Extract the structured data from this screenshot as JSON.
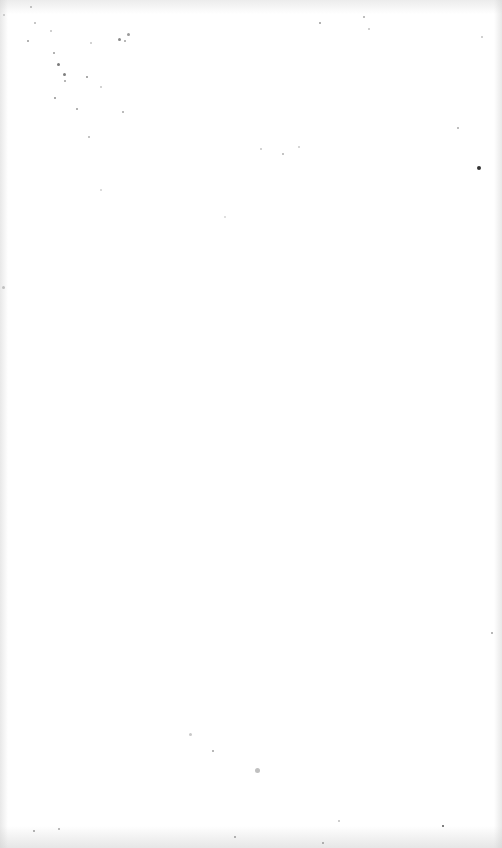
{
  "page": {
    "background": "#ffffff",
    "content_text": ""
  },
  "specks": [
    {
      "x": 30,
      "y": 6,
      "s": 2,
      "c": "#b0b0b0"
    },
    {
      "x": 3,
      "y": 14,
      "s": 2,
      "c": "#c0c0c0"
    },
    {
      "x": 34,
      "y": 22,
      "s": 2,
      "c": "#b5b5b5"
    },
    {
      "x": 27,
      "y": 40,
      "s": 2,
      "c": "#9a9a9a"
    },
    {
      "x": 50,
      "y": 30,
      "s": 2,
      "c": "#c0c0c0"
    },
    {
      "x": 118,
      "y": 38,
      "s": 3,
      "c": "#8a8a8a"
    },
    {
      "x": 127,
      "y": 33,
      "s": 3,
      "c": "#9a9a9a"
    },
    {
      "x": 124,
      "y": 40,
      "s": 2,
      "c": "#a0a0a0"
    },
    {
      "x": 90,
      "y": 42,
      "s": 2,
      "c": "#c5c5c5"
    },
    {
      "x": 53,
      "y": 52,
      "s": 2,
      "c": "#9a9a9a"
    },
    {
      "x": 57,
      "y": 63,
      "s": 3,
      "c": "#7a7a7a"
    },
    {
      "x": 63,
      "y": 73,
      "s": 3,
      "c": "#7f7f7f"
    },
    {
      "x": 64,
      "y": 80,
      "s": 2,
      "c": "#9f9f9f"
    },
    {
      "x": 86,
      "y": 76,
      "s": 2,
      "c": "#8f8f8f"
    },
    {
      "x": 100,
      "y": 86,
      "s": 2,
      "c": "#c5c5c5"
    },
    {
      "x": 54,
      "y": 97,
      "s": 2,
      "c": "#8f8f8f"
    },
    {
      "x": 76,
      "y": 108,
      "s": 2,
      "c": "#9a9a9a"
    },
    {
      "x": 122,
      "y": 111,
      "s": 2,
      "c": "#a5a5a5"
    },
    {
      "x": 88,
      "y": 136,
      "s": 2,
      "c": "#b0b0b0"
    },
    {
      "x": 100,
      "y": 189,
      "s": 2,
      "c": "#d0d0d0"
    },
    {
      "x": 319,
      "y": 22,
      "s": 2,
      "c": "#9a9a9a"
    },
    {
      "x": 363,
      "y": 16,
      "s": 2,
      "c": "#a8a8a8"
    },
    {
      "x": 368,
      "y": 28,
      "s": 2,
      "c": "#c0c0c0"
    },
    {
      "x": 481,
      "y": 36,
      "s": 2,
      "c": "#c0c0c0"
    },
    {
      "x": 457,
      "y": 127,
      "s": 2,
      "c": "#a8a8a8"
    },
    {
      "x": 477,
      "y": 166,
      "s": 4,
      "c": "#333333"
    },
    {
      "x": 260,
      "y": 148,
      "s": 2,
      "c": "#c5c5c5"
    },
    {
      "x": 282,
      "y": 153,
      "s": 2,
      "c": "#b0b0b0"
    },
    {
      "x": 298,
      "y": 146,
      "s": 2,
      "c": "#c8c8c8"
    },
    {
      "x": 224,
      "y": 216,
      "s": 2,
      "c": "#d5d5d5"
    },
    {
      "x": 2,
      "y": 286,
      "s": 3,
      "c": "#c0c0c0"
    },
    {
      "x": 491,
      "y": 632,
      "s": 2,
      "c": "#a0a0a0"
    },
    {
      "x": 189,
      "y": 733,
      "s": 3,
      "c": "#c8c8c8"
    },
    {
      "x": 212,
      "y": 750,
      "s": 2,
      "c": "#a0a0a0"
    },
    {
      "x": 255,
      "y": 768,
      "s": 5,
      "c": "#c0c0c0"
    },
    {
      "x": 33,
      "y": 830,
      "s": 2,
      "c": "#9a9a9a"
    },
    {
      "x": 58,
      "y": 828,
      "s": 2,
      "c": "#a5a5a5"
    },
    {
      "x": 234,
      "y": 836,
      "s": 2,
      "c": "#9a9a9a"
    },
    {
      "x": 442,
      "y": 825,
      "s": 2,
      "c": "#555555"
    },
    {
      "x": 338,
      "y": 820,
      "s": 2,
      "c": "#bdbdbd"
    },
    {
      "x": 322,
      "y": 842,
      "s": 2,
      "c": "#9a9a9a"
    }
  ]
}
